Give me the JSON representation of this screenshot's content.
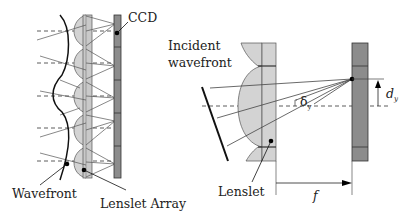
{
  "left_diagram": {
    "labels": {
      "ccd": "CCD",
      "wavefront": "Wavefront",
      "lenslet_array": "Lenslet Array"
    },
    "lenslet_count": 5
  },
  "right_diagram": {
    "labels": {
      "incident_line1": "Incident",
      "incident_line2": "wavefront",
      "lenslet": "Lenslet",
      "focal_length": "f",
      "delta": "δ",
      "delta_sub": "y",
      "displacement": "d",
      "displacement_sub": "y"
    }
  },
  "colors": {
    "lens_fill": "#d3d3d3",
    "ccd_fill": "#8c8c8c",
    "stroke": "#2a2a2a",
    "ray": "#444444"
  }
}
